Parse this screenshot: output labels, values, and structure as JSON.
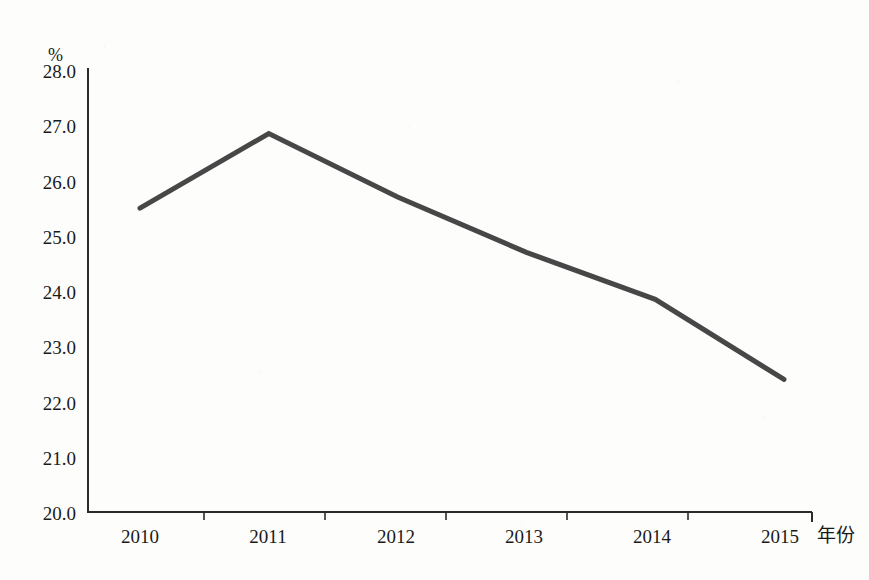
{
  "chart_data": {
    "type": "line",
    "title": "",
    "subtitle": "",
    "xlabel": "年份",
    "ylabel": "%",
    "unit_label": "%",
    "categories": [
      "2010",
      "2011",
      "2012",
      "2013",
      "2014",
      "2015"
    ],
    "x": [
      2010,
      2011,
      2012,
      2013,
      2014,
      2015
    ],
    "values": [
      25.5,
      26.85,
      25.7,
      24.7,
      23.85,
      22.4
    ],
    "series": [
      {
        "name": "",
        "values": [
          25.5,
          26.85,
          25.7,
          24.7,
          23.85,
          22.4
        ]
      }
    ],
    "ytick_labels": [
      "28.0",
      "27.0",
      "26.0",
      "25.0",
      "24.0",
      "23.0",
      "22.0",
      "21.0",
      "20.0"
    ],
    "ytick_values": [
      28.0,
      27.0,
      26.0,
      25.0,
      24.0,
      23.0,
      22.0,
      21.0,
      20.0
    ],
    "ylim": [
      20.0,
      28.0
    ],
    "ytick_step": 1.0,
    "grid": false,
    "legend": false,
    "legend_position": "none",
    "markers": false,
    "line_color": "#474747",
    "axis_color": "#2b2b2b",
    "background_color": "#fdfdfc",
    "text_color": "#1a1a1a",
    "line_width": 5
  }
}
